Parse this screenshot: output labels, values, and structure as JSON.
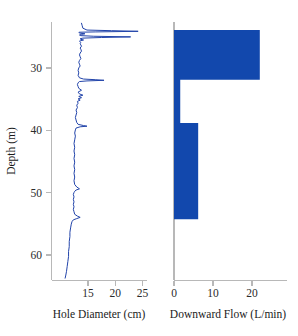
{
  "chart_data": [
    {
      "type": "line",
      "panel": "left",
      "title": "",
      "xlabel": "Hole Diameter (cm)",
      "ylabel": "Depth (m)",
      "xlim": [
        12.2,
        26.2
      ],
      "ylim": [
        22.6,
        64.2
      ],
      "y_inverted": true,
      "xticks": [
        15,
        20,
        25
      ],
      "yticks": [
        30,
        40,
        50,
        60
      ],
      "grid": false,
      "legend": "none",
      "series_color": "#2244aa",
      "series": [
        {
          "name": "Hole Diameter",
          "depth_m": [
            22.8,
            23.2,
            23.6,
            23.9,
            24.0,
            24.1,
            24.2,
            24.25,
            24.3,
            24.4,
            24.5,
            24.6,
            24.7,
            24.8,
            24.9,
            25.0,
            25.1,
            25.2,
            25.3,
            25.4,
            25.5,
            25.6,
            25.7,
            25.8,
            25.9,
            26.1,
            26.3,
            26.5,
            26.8,
            27.0,
            27.3,
            27.6,
            27.9,
            28.2,
            28.5,
            28.8,
            29.1,
            29.4,
            29.7,
            30.0,
            30.4,
            30.8,
            31.2,
            31.6,
            31.8,
            31.9,
            32.0,
            32.1,
            32.2,
            32.4,
            32.7,
            33.0,
            33.3,
            33.6,
            33.9,
            34.2,
            34.4,
            34.6,
            34.8,
            35.0,
            35.2,
            35.4,
            35.7,
            36.0,
            36.4,
            36.8,
            37.2,
            37.6,
            38.0,
            38.4,
            38.8,
            39.1,
            39.3,
            39.4,
            39.5,
            39.7,
            40.0,
            40.5,
            41.0,
            41.6,
            42.2,
            42.8,
            43.4,
            44.0,
            44.6,
            45.2,
            45.8,
            46.4,
            47.0,
            47.6,
            48.2,
            48.8,
            49.2,
            49.5,
            49.7,
            49.9,
            50.1,
            50.4,
            50.8,
            51.2,
            51.6,
            52.0,
            52.4,
            52.8,
            53.2,
            53.6,
            53.9,
            54.1,
            54.3,
            54.5,
            54.8,
            55.2,
            55.8,
            56.5,
            57.2,
            58.0,
            58.8,
            59.6,
            60.4,
            61.2,
            62.0,
            62.8,
            63.4,
            63.9
          ],
          "diameter_cm": [
            16.6,
            16.7,
            16.8,
            17.4,
            21.0,
            24.9,
            18.6,
            16.3,
            16.2,
            16.4,
            17.1,
            16.6,
            16.3,
            16.5,
            18.4,
            23.8,
            19.5,
            16.8,
            16.4,
            16.5,
            16.9,
            16.5,
            16.3,
            16.4,
            16.5,
            16.4,
            16.5,
            16.6,
            16.4,
            16.5,
            16.6,
            16.4,
            16.3,
            16.4,
            16.5,
            16.3,
            16.2,
            16.3,
            16.4,
            16.2,
            16.1,
            16.2,
            16.1,
            16.3,
            16.9,
            18.6,
            19.9,
            17.4,
            16.3,
            16.1,
            16.0,
            16.1,
            16.2,
            16.6,
            16.1,
            16.3,
            16.8,
            16.2,
            16.6,
            16.1,
            16.4,
            16.0,
            16.1,
            15.9,
            16.0,
            15.8,
            15.9,
            15.8,
            15.7,
            15.8,
            15.9,
            16.1,
            16.9,
            17.4,
            16.4,
            15.8,
            15.7,
            15.6,
            15.7,
            15.6,
            15.5,
            15.6,
            15.5,
            15.6,
            15.5,
            15.6,
            15.5,
            15.6,
            15.5,
            15.6,
            15.5,
            15.6,
            15.9,
            16.3,
            15.8,
            15.6,
            15.5,
            15.4,
            15.5,
            15.4,
            15.5,
            15.4,
            15.5,
            15.4,
            15.5,
            15.6,
            16.0,
            16.4,
            15.9,
            15.4,
            15.2,
            15.1,
            15.0,
            14.9,
            14.9,
            14.8,
            14.8,
            14.7,
            14.7,
            14.6,
            14.5,
            14.4,
            14.3,
            14.2
          ]
        }
      ]
    },
    {
      "type": "area",
      "panel": "right",
      "title": "",
      "xlabel": "Downward Flow (L/min)",
      "ylabel": "Depth (m)",
      "xlim": [
        -1.5,
        25.5
      ],
      "ylim": [
        22.6,
        64.2
      ],
      "y_inverted": true,
      "xticks": [
        0,
        10,
        20
      ],
      "yticks": [
        30,
        40,
        50,
        60
      ],
      "grid": false,
      "legend": "none",
      "series_color": "#1248ad",
      "steps": [
        {
          "depth_top_m": 22.6,
          "depth_bottom_m": 23.9,
          "flow_lpm": 0.0
        },
        {
          "depth_top_m": 23.9,
          "depth_bottom_m": 31.9,
          "flow_lpm": 22.0
        },
        {
          "depth_top_m": 31.9,
          "depth_bottom_m": 38.9,
          "flow_lpm": 1.6
        },
        {
          "depth_top_m": 38.9,
          "depth_bottom_m": 54.4,
          "flow_lpm": 6.2
        },
        {
          "depth_top_m": 54.4,
          "depth_bottom_m": 64.2,
          "flow_lpm": 0.0
        }
      ]
    }
  ],
  "axes": {
    "depth_label": "Depth (m)",
    "depth_ticks": [
      "30",
      "40",
      "50",
      "60"
    ],
    "left_xticks": [
      "15",
      "20",
      "25"
    ],
    "left_xlabel": "Hole Diameter (cm)",
    "right_xticks": [
      "0",
      "10",
      "20"
    ],
    "right_xlabel": "Downward Flow (L/min)"
  },
  "colors": {
    "trace": "#2244aa",
    "fill": "#1248ad",
    "axis": "#b8b8b8",
    "text": "#1a1a1a",
    "background": "#ffffff"
  }
}
